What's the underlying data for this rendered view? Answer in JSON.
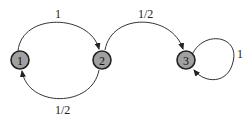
{
  "diagram": {
    "type": "markov-chain",
    "nodes": [
      {
        "id": "1",
        "label": "1"
      },
      {
        "id": "2",
        "label": "2"
      },
      {
        "id": "3",
        "label": "3"
      }
    ],
    "edges": [
      {
        "from": "1",
        "to": "2",
        "label": "1"
      },
      {
        "from": "2",
        "to": "1",
        "label": "1/2"
      },
      {
        "from": "2",
        "to": "3",
        "label": "1/2"
      },
      {
        "from": "3",
        "to": "3",
        "label": "1"
      }
    ],
    "colors": {
      "node_fill": "#a0a0a0",
      "node_stroke": "#222222",
      "edge": "#333333"
    }
  }
}
